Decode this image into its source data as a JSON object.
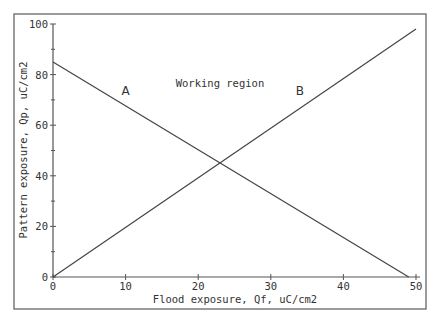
{
  "chart_data": {
    "type": "line",
    "title": "",
    "xlabel": "Flood exposure, Qf, uC/cm2",
    "ylabel": "Pattern exposure, Qp, uC/cm2",
    "xlim": [
      0,
      50
    ],
    "ylim": [
      0,
      100
    ],
    "x_ticks": [
      0,
      10,
      20,
      30,
      40,
      50
    ],
    "x_tick_labels": [
      "0",
      "10",
      "20",
      "30",
      "40",
      "50"
    ],
    "x_minor_ticks": [],
    "y_ticks": [
      0,
      20,
      40,
      60,
      80,
      100
    ],
    "y_tick_labels": [
      "0",
      "20",
      "40",
      "60",
      "80",
      "100"
    ],
    "y_minor_ticks": [
      10,
      30,
      50,
      70,
      90
    ],
    "grid": false,
    "series": [
      {
        "name": "A",
        "x": [
          0,
          49
        ],
        "y": [
          85,
          0
        ],
        "label_at": [
          10,
          72
        ]
      },
      {
        "name": "B",
        "x": [
          0,
          50
        ],
        "y": [
          0,
          98
        ],
        "label_at": [
          34,
          72
        ]
      }
    ],
    "annotations": [
      {
        "text": "Working region",
        "x": 23,
        "y": 75
      }
    ],
    "line_color": "#444444"
  }
}
